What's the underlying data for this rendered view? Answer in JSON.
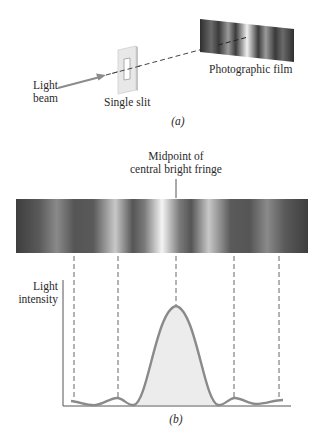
{
  "part_a": {
    "caption": "(a)",
    "labels": {
      "light_beam_line1": "Light",
      "light_beam_line2": "beam",
      "single_slit": "Single slit",
      "photographic_film": "Photographic film"
    }
  },
  "part_b": {
    "caption": "(b)",
    "labels": {
      "midpoint_line1": "Midpoint of",
      "midpoint_line2": "central bright fringe",
      "y_axis_line1": "Light",
      "y_axis_line2": "intensity"
    },
    "fringe_band": {
      "description": "Diffraction pattern: bright central fringe flanked by alternating dark and weaker bright fringes",
      "colors": {
        "dark": "#3a3a3a",
        "bright": "#f2f2f2",
        "mid": "#8a8a8a"
      }
    },
    "dashed_guides_x": [
      74,
      118,
      176,
      234,
      279
    ]
  },
  "colors": {
    "curve": "#8a8a8a",
    "curve_fill": "#ececec",
    "axis": "#555555",
    "dash": "#666666",
    "arrow": "#8c8c8c",
    "text": "#2a2a2a"
  }
}
